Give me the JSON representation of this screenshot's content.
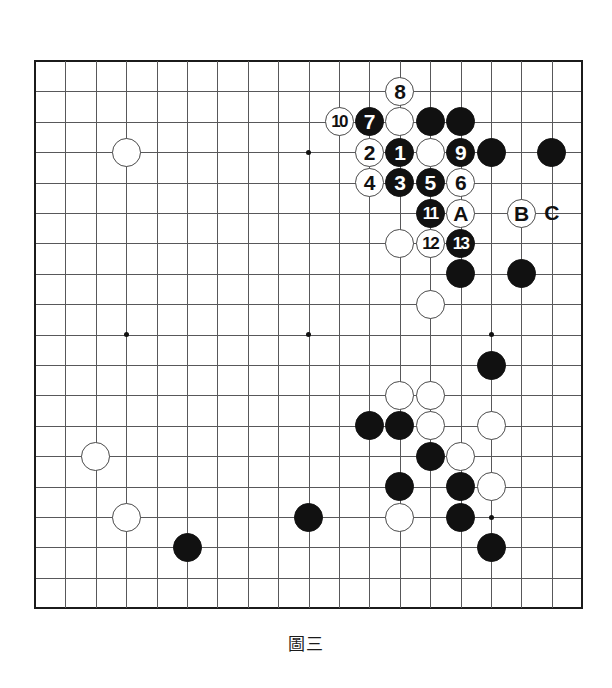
{
  "diagram": {
    "kind": "go-board-diagram",
    "board_size": 19,
    "caption": "圖三",
    "caption_parts": [
      "圖",
      "三"
    ],
    "colors": {
      "black_stone": "#111111",
      "white_stone": "#ffffff",
      "stone_outline": "#4a4a4a",
      "grid_line": "#58585a",
      "board_border": "#1b1b1b",
      "background": "#ffffff"
    },
    "geometry": {
      "origin_x": 35,
      "origin_y": 61,
      "spacing": 30.4,
      "stone_diameter": 29,
      "star_points": [
        {
          "col": 4,
          "row": 4
        },
        {
          "col": 10,
          "row": 4
        },
        {
          "col": 16,
          "row": 4
        },
        {
          "col": 4,
          "row": 10
        },
        {
          "col": 10,
          "row": 10
        },
        {
          "col": 16,
          "row": 10
        },
        {
          "col": 4,
          "row": 16
        },
        {
          "col": 10,
          "row": 16
        },
        {
          "col": 16,
          "row": 16
        }
      ]
    },
    "stones": [
      {
        "col": 4,
        "row": 4,
        "color": "white",
        "label": ""
      },
      {
        "col": 13,
        "row": 2,
        "color": "white",
        "label": "8"
      },
      {
        "col": 11,
        "row": 3,
        "color": "white",
        "label": "10"
      },
      {
        "col": 12,
        "row": 3,
        "color": "black",
        "label": "7"
      },
      {
        "col": 13,
        "row": 3,
        "color": "white",
        "label": ""
      },
      {
        "col": 14,
        "row": 3,
        "color": "black",
        "label": ""
      },
      {
        "col": 15,
        "row": 3,
        "color": "black",
        "label": ""
      },
      {
        "col": 12,
        "row": 4,
        "color": "white",
        "label": "2"
      },
      {
        "col": 13,
        "row": 4,
        "color": "black",
        "label": "1"
      },
      {
        "col": 14,
        "row": 4,
        "color": "white",
        "label": ""
      },
      {
        "col": 15,
        "row": 4,
        "color": "black",
        "label": "9"
      },
      {
        "col": 16,
        "row": 4,
        "color": "black",
        "label": ""
      },
      {
        "col": 18,
        "row": 4,
        "color": "black",
        "label": ""
      },
      {
        "col": 12,
        "row": 5,
        "color": "white",
        "label": "4"
      },
      {
        "col": 13,
        "row": 5,
        "color": "black",
        "label": "3"
      },
      {
        "col": 14,
        "row": 5,
        "color": "black",
        "label": "5"
      },
      {
        "col": 15,
        "row": 5,
        "color": "white",
        "label": "6"
      },
      {
        "col": 14,
        "row": 6,
        "color": "black",
        "label": "11"
      },
      {
        "col": 15,
        "row": 6,
        "color": "white",
        "label": "A"
      },
      {
        "col": 17,
        "row": 6,
        "color": "white",
        "label": "B"
      },
      {
        "col": 13,
        "row": 7,
        "color": "white",
        "label": ""
      },
      {
        "col": 14,
        "row": 7,
        "color": "white",
        "label": "12"
      },
      {
        "col": 15,
        "row": 7,
        "color": "black",
        "label": "13"
      },
      {
        "col": 15,
        "row": 8,
        "color": "black",
        "label": ""
      },
      {
        "col": 17,
        "row": 8,
        "color": "black",
        "label": ""
      },
      {
        "col": 14,
        "row": 9,
        "color": "white",
        "label": ""
      },
      {
        "col": 16,
        "row": 11,
        "color": "black",
        "label": ""
      },
      {
        "col": 13,
        "row": 12,
        "color": "white",
        "label": ""
      },
      {
        "col": 14,
        "row": 12,
        "color": "white",
        "label": ""
      },
      {
        "col": 12,
        "row": 13,
        "color": "black",
        "label": ""
      },
      {
        "col": 13,
        "row": 13,
        "color": "black",
        "label": ""
      },
      {
        "col": 14,
        "row": 13,
        "color": "white",
        "label": ""
      },
      {
        "col": 16,
        "row": 13,
        "color": "white",
        "label": ""
      },
      {
        "col": 3,
        "row": 14,
        "color": "white",
        "label": ""
      },
      {
        "col": 14,
        "row": 14,
        "color": "black",
        "label": ""
      },
      {
        "col": 15,
        "row": 14,
        "color": "white",
        "label": ""
      },
      {
        "col": 13,
        "row": 15,
        "color": "black",
        "label": ""
      },
      {
        "col": 15,
        "row": 15,
        "color": "black",
        "label": ""
      },
      {
        "col": 16,
        "row": 15,
        "color": "white",
        "label": ""
      },
      {
        "col": 4,
        "row": 16,
        "color": "white",
        "label": ""
      },
      {
        "col": 10,
        "row": 16,
        "color": "black",
        "label": ""
      },
      {
        "col": 13,
        "row": 16,
        "color": "white",
        "label": ""
      },
      {
        "col": 15,
        "row": 16,
        "color": "black",
        "label": ""
      },
      {
        "col": 6,
        "row": 17,
        "color": "black",
        "label": ""
      },
      {
        "col": 16,
        "row": 17,
        "color": "black",
        "label": ""
      }
    ],
    "plain_markers": [
      {
        "col": 18,
        "row": 6,
        "label": "C"
      }
    ],
    "move_numbers": [
      "1",
      "2",
      "3",
      "4",
      "5",
      "6",
      "7",
      "8",
      "9",
      "10",
      "11",
      "12",
      "13"
    ],
    "point_labels": [
      "A",
      "B",
      "C"
    ]
  }
}
